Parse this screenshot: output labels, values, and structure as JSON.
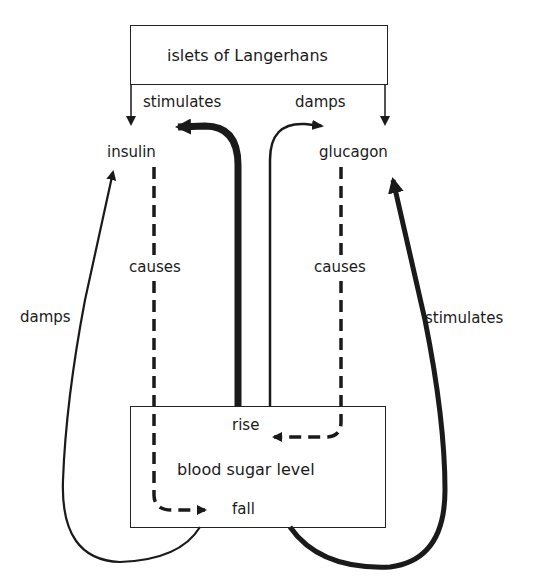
{
  "diagram": {
    "title_box": {
      "label": "islets of Langerhans"
    },
    "hormones": {
      "left": "insulin",
      "right": "glucagon"
    },
    "top_labels": {
      "left": "stimulates",
      "right": "damps"
    },
    "side_labels": {
      "left": "damps",
      "right": "stimulates"
    },
    "causes_labels": {
      "left": "causes",
      "right": "causes"
    },
    "level_box": {
      "label": "blood sugar level",
      "rise": "rise",
      "fall": "fall"
    },
    "colors": {
      "line": "#1a1a1a",
      "background": "#ffffff"
    },
    "relations": [
      {
        "from": "islets of Langerhans",
        "to": "insulin",
        "type": "arrow"
      },
      {
        "from": "islets of Langerhans",
        "to": "glucagon",
        "type": "arrow"
      },
      {
        "from": "blood sugar level rise",
        "to": "insulin",
        "label": "stimulates",
        "style": "thick"
      },
      {
        "from": "blood sugar level rise",
        "to": "glucagon",
        "label": "damps",
        "style": "thin"
      },
      {
        "from": "insulin",
        "to": "blood sugar level fall",
        "label": "causes",
        "style": "dashed"
      },
      {
        "from": "glucagon",
        "to": "blood sugar level rise",
        "label": "causes",
        "style": "dashed"
      },
      {
        "from": "blood sugar level fall",
        "to": "insulin",
        "label": "damps",
        "style": "thin"
      },
      {
        "from": "blood sugar level fall",
        "to": "glucagon",
        "label": "stimulates",
        "style": "thick"
      }
    ]
  }
}
